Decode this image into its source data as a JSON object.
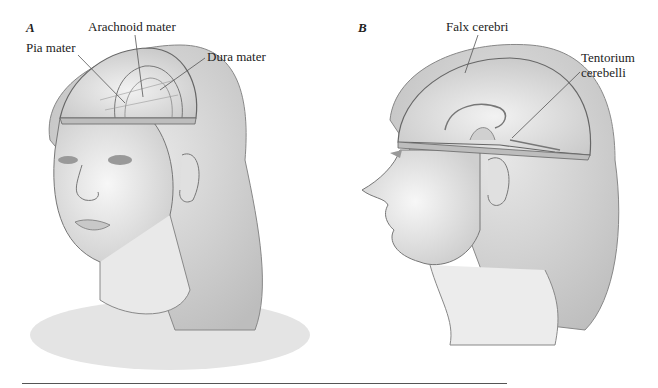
{
  "figure": {
    "panels": [
      {
        "letter": "A",
        "view": "front three-quarter view of head with cutaway skull",
        "labels": [
          "Pia mater",
          "Arachnoid mater",
          "Dura mater"
        ]
      },
      {
        "letter": "B",
        "view": "lateral view of head with cutaway skull",
        "labels": [
          "Falx cerebri",
          "Tentorium cerebelli"
        ]
      }
    ],
    "colors": {
      "line": "#555555",
      "shade": "#d9d9d9",
      "skin": "#efefef",
      "text": "#222222"
    }
  }
}
